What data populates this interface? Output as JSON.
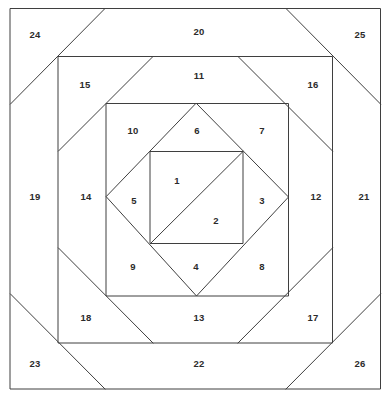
{
  "diagram": {
    "type": "numbered-patchwork-piecing-diagram",
    "canvas": {
      "width": 389,
      "height": 403
    },
    "colors": {
      "line": "#3f3f3f",
      "background": "#ffffff",
      "label": "#2b2b2b",
      "caption": "#bdbdbd"
    },
    "caption": "",
    "geometry": {
      "outer_square": {
        "left": 10,
        "top": 8,
        "right": 381,
        "bottom": 389
      },
      "ring2_square": {
        "left": 58,
        "top": 56,
        "right": 333,
        "bottom": 343
      },
      "ring3_square": {
        "left": 106,
        "top": 103,
        "right": 289,
        "bottom": 296
      },
      "diamond": {
        "top": [
          196,
          103
        ],
        "right": [
          289,
          197
        ],
        "bottom": [
          196,
          296
        ],
        "left": [
          106,
          197
        ]
      },
      "center_square": {
        "left": 150,
        "top": 151,
        "right": 243,
        "bottom": 243
      },
      "center_diagonal": [
        [
          243,
          151
        ],
        [
          150,
          243
        ]
      ]
    },
    "pieces": [
      {
        "number": "1",
        "x": 177,
        "y": 180,
        "region": "center-upper-left-triangle"
      },
      {
        "number": "2",
        "x": 216,
        "y": 220,
        "region": "center-lower-right-triangle"
      },
      {
        "number": "3",
        "x": 262,
        "y": 200,
        "region": "diamond-right"
      },
      {
        "number": "4",
        "x": 196,
        "y": 266,
        "region": "diamond-bottom"
      },
      {
        "number": "5",
        "x": 134,
        "y": 200,
        "region": "diamond-left"
      },
      {
        "number": "6",
        "x": 197,
        "y": 130,
        "region": "diamond-top"
      },
      {
        "number": "7",
        "x": 262,
        "y": 130,
        "region": "ring3-corner-top-right"
      },
      {
        "number": "8",
        "x": 262,
        "y": 266,
        "region": "ring3-corner-bottom-right"
      },
      {
        "number": "9",
        "x": 133,
        "y": 266,
        "region": "ring3-corner-bottom-left"
      },
      {
        "number": "10",
        "x": 133,
        "y": 130,
        "region": "ring3-corner-top-left"
      },
      {
        "number": "11",
        "x": 199,
        "y": 75,
        "region": "ring2-top"
      },
      {
        "number": "12",
        "x": 316,
        "y": 196,
        "region": "ring2-right"
      },
      {
        "number": "13",
        "x": 199,
        "y": 317,
        "region": "ring2-bottom"
      },
      {
        "number": "14",
        "x": 86,
        "y": 196,
        "region": "ring2-left"
      },
      {
        "number": "15",
        "x": 85,
        "y": 84,
        "region": "ring2-corner-top-left"
      },
      {
        "number": "16",
        "x": 313,
        "y": 84,
        "region": "ring2-corner-top-right"
      },
      {
        "number": "17",
        "x": 313,
        "y": 317,
        "region": "ring2-corner-bottom-right"
      },
      {
        "number": "18",
        "x": 86,
        "y": 317,
        "region": "ring2-corner-bottom-left"
      },
      {
        "number": "19",
        "x": 35,
        "y": 196,
        "region": "outer-left"
      },
      {
        "number": "20",
        "x": 199,
        "y": 31,
        "region": "outer-top"
      },
      {
        "number": "21",
        "x": 364,
        "y": 196,
        "region": "outer-right"
      },
      {
        "number": "22",
        "x": 199,
        "y": 363,
        "region": "outer-bottom"
      },
      {
        "number": "23",
        "x": 35,
        "y": 363,
        "region": "outer-corner-bottom-left"
      },
      {
        "number": "24",
        "x": 35,
        "y": 34,
        "region": "outer-corner-top-left"
      },
      {
        "number": "25",
        "x": 360,
        "y": 34,
        "region": "outer-corner-top-right"
      },
      {
        "number": "26",
        "x": 360,
        "y": 363,
        "region": "outer-corner-bottom-right"
      }
    ]
  }
}
